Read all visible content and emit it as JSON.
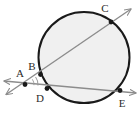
{
  "figure": {
    "background_color": "#ffffff"
  },
  "circle": {
    "name": "circle",
    "center_x": 84,
    "center_y": 57.5,
    "radius": 45.5,
    "stroke_color": "#1a1a1a",
    "stroke_width": 2.0,
    "fill_color": "#f0f0f0"
  },
  "points": [
    {
      "id": "A",
      "label": "A",
      "x": 25,
      "y": 84.5,
      "label_x": 20,
      "label_y": 77,
      "dot": true,
      "role": "external-vertex"
    },
    {
      "id": "B",
      "label": "B",
      "x": 40.5,
      "y": 74.5,
      "label_x": 32,
      "label_y": 70,
      "dot": true,
      "role": "near-intersection-upper-secant"
    },
    {
      "id": "C",
      "label": "C",
      "x": 111,
      "y": 22,
      "label_x": 105,
      "label_y": 12,
      "dot": true,
      "role": "far-intersection-upper-secant"
    },
    {
      "id": "D",
      "label": "D",
      "x": 47,
      "y": 88.5,
      "label_x": 40,
      "label_y": 102,
      "dot": true,
      "role": "near-intersection-lower-secant"
    },
    {
      "id": "E",
      "label": "E",
      "x": 120,
      "y": 90.5,
      "label_x": 122,
      "label_y": 107,
      "dot": true,
      "role": "far-intersection-lower-secant"
    }
  ],
  "lines": [
    {
      "id": "line-ABC",
      "name": "secant-line-through-A-B-C",
      "from": "lower-left",
      "through": [
        "A",
        "B",
        "C"
      ],
      "x1": 6,
      "y1": 94.5,
      "x2": 131,
      "y2": 9,
      "stroke_color": "#8c8c8c",
      "stroke_width": 1.4,
      "arrow_start": true,
      "arrow_end": true
    },
    {
      "id": "line-ADE",
      "name": "secant-line-through-A-D-E",
      "from": "left",
      "through": [
        "A",
        "D",
        "E"
      ],
      "x1": 4,
      "y1": 81,
      "x2": 136,
      "y2": 93,
      "stroke_color": "#8c8c8c",
      "stroke_width": 1.4,
      "arrow_start": true,
      "arrow_end": true
    }
  ],
  "angle_mark": {
    "name": "angle-at-A",
    "vertex": "A",
    "radius": 13,
    "stroke_color": "#9a9a9a",
    "description": "small arc marking the angle between the two secants at A"
  },
  "colors": {
    "circle_stroke": "#1a1a1a",
    "circle_fill": "#f0f0f0",
    "line_stroke": "#8c8c8c",
    "point_fill": "#1a1a1a",
    "label_fill": "#2b2b2b",
    "background": "#ffffff"
  }
}
